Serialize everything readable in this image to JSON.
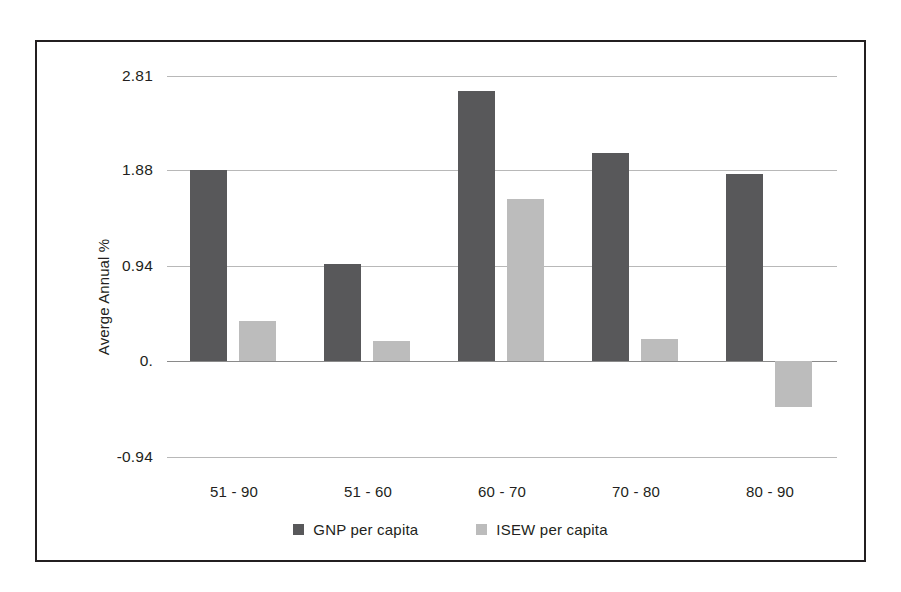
{
  "chart_data": {
    "type": "bar",
    "title": "",
    "subtitle": "",
    "xlabel": "",
    "ylabel": "Averge Annual %",
    "categories": [
      "51 - 90",
      "51 - 60",
      "60 - 70",
      "70 - 80",
      "80 - 90"
    ],
    "series": [
      {
        "name": "GNP per capita",
        "color": "#58585a",
        "values": [
          1.88,
          0.96,
          2.66,
          2.05,
          1.85
        ]
      },
      {
        "name": "ISEW per capita",
        "color": "#bcbcbc",
        "values": [
          0.4,
          0.2,
          1.6,
          0.22,
          -0.45
        ]
      }
    ],
    "ylim": [
      -0.94,
      2.81
    ],
    "yticks": [
      2.81,
      1.88,
      0.94,
      0.0,
      -0.94
    ],
    "ytick_labels": [
      "2.81",
      "1.88",
      "0.94",
      "0.",
      "-0.94"
    ],
    "grid": true,
    "legend_position": "bottom",
    "border": true,
    "border_color": "#231f20",
    "gridline_color": "#b8b8b8",
    "background": "#ffffff"
  }
}
